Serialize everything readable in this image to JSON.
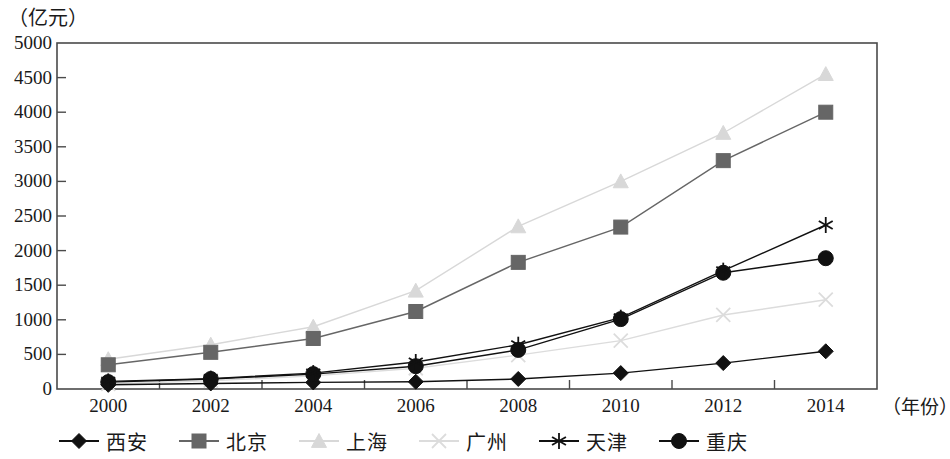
{
  "chart_data": {
    "type": "line",
    "title": "",
    "xlabel": "（年份）",
    "ylabel": "（亿元）",
    "categories": [
      2000,
      2002,
      2004,
      2006,
      2008,
      2010,
      2012,
      2014
    ],
    "tick_labels_x": [
      "2000",
      "2002",
      "2004",
      "2006",
      "2008",
      "2010",
      "2012",
      "2014"
    ],
    "tick_labels_y": [
      "0",
      "500",
      "1000",
      "1500",
      "2000",
      "2500",
      "3000",
      "3500",
      "4000",
      "4500",
      "5000"
    ],
    "ylim": [
      0,
      5000
    ],
    "ytick_step": 500,
    "grid": false,
    "legend_position": "bottom",
    "series": [
      {
        "name": "西安",
        "marker": "diamond",
        "color": "#111111",
        "values": [
          60,
          80,
          95,
          105,
          145,
          230,
          375,
          545
        ]
      },
      {
        "name": "北京",
        "marker": "square",
        "color": "#666666",
        "values": [
          350,
          530,
          730,
          1120,
          1830,
          2340,
          3300,
          4000
        ]
      },
      {
        "name": "上海",
        "marker": "triangle",
        "color": "#d8d8d8",
        "values": [
          430,
          640,
          900,
          1420,
          2350,
          3000,
          3700,
          4550
        ]
      },
      {
        "name": "广州",
        "marker": "cross",
        "color": "#dcdcdc",
        "values": [
          75,
          120,
          190,
          300,
          490,
          700,
          1070,
          1290
        ]
      },
      {
        "name": "天津",
        "marker": "asterisk",
        "color": "#111111",
        "values": [
          110,
          150,
          230,
          390,
          640,
          1030,
          1710,
          2370
        ]
      },
      {
        "name": "重庆",
        "marker": "circle",
        "color": "#111111",
        "values": [
          100,
          145,
          215,
          330,
          565,
          1010,
          1680,
          1890
        ]
      }
    ]
  }
}
